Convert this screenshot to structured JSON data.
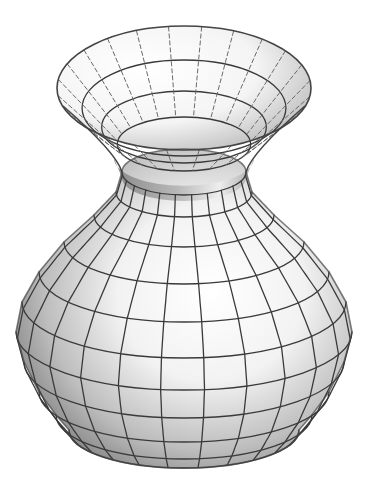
{
  "figure": {
    "background": "#ffffff",
    "surface_color_light": "#ffffff",
    "surface_color_dark": "#8a8a8a",
    "grid_color": "#3a3a3a"
  },
  "vase": {
    "center_x": 184,
    "profile": [
      {
        "t": 0.0,
        "cy": 88,
        "rx": 127,
        "ry": 62
      },
      {
        "t": 0.1,
        "cy": 112,
        "rx": 104,
        "ry": 48
      },
      {
        "t": 0.2,
        "cy": 135,
        "rx": 84,
        "ry": 36
      },
      {
        "t": 0.3,
        "cy": 156,
        "rx": 68,
        "ry": 27
      },
      {
        "t": 0.38,
        "cy": 172,
        "rx": 62,
        "ry": 23
      },
      {
        "t": 0.46,
        "cy": 192,
        "rx": 68,
        "ry": 25
      },
      {
        "t": 0.54,
        "cy": 215,
        "rx": 90,
        "ry": 32
      },
      {
        "t": 0.62,
        "cy": 242,
        "rx": 120,
        "ry": 42
      },
      {
        "t": 0.7,
        "cy": 272,
        "rx": 145,
        "ry": 50
      },
      {
        "t": 0.78,
        "cy": 302,
        "rx": 162,
        "ry": 56
      },
      {
        "t": 0.86,
        "cy": 332,
        "rx": 168,
        "ry": 58
      },
      {
        "t": 0.92,
        "cy": 362,
        "rx": 160,
        "ry": 56
      },
      {
        "t": 0.96,
        "cy": 392,
        "rx": 145,
        "ry": 50
      },
      {
        "t": 0.985,
        "cy": 415,
        "rx": 128,
        "ry": 44
      },
      {
        "t": 1.0,
        "cy": 430,
        "rx": 115,
        "ry": 38
      }
    ],
    "meridian_count": 24,
    "view_rotation_deg": 8
  }
}
